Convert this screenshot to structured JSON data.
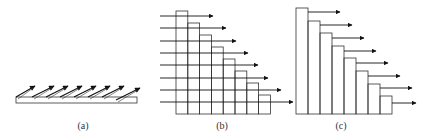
{
  "figure": {
    "stroke_color": "#333333",
    "arrow_color": "#111111",
    "panels": [
      {
        "id": "a",
        "label": "(a)",
        "label_x": 68,
        "description": "thin slab with 8 inclined arrows",
        "slab": {
          "x": 16,
          "y": 97,
          "w": 121,
          "h": 6
        },
        "arrows": [
          {
            "x1": 16,
            "y1": 97,
            "x2": 35,
            "y2": 86
          },
          {
            "x1": 32,
            "y1": 97,
            "x2": 54,
            "y2": 86
          },
          {
            "x1": 46,
            "y1": 97,
            "x2": 68,
            "y2": 86
          },
          {
            "x1": 60,
            "y1": 97,
            "x2": 82,
            "y2": 86
          },
          {
            "x1": 74,
            "y1": 97,
            "x2": 96,
            "y2": 86
          },
          {
            "x1": 88,
            "y1": 97,
            "x2": 110,
            "y2": 86
          },
          {
            "x1": 102,
            "y1": 97,
            "x2": 124,
            "y2": 86
          },
          {
            "x1": 116,
            "y1": 100,
            "x2": 140,
            "y2": 88
          }
        ]
      },
      {
        "id": "b",
        "label": "(b)",
        "label_x": 207,
        "description": "staircase of 8 columns crossed by 8 horizontal arrows",
        "base_x": 176,
        "base_y": 114,
        "col_w": 11.8,
        "col_tops": [
          11,
          23,
          35,
          47,
          59,
          71,
          83,
          95
        ],
        "arrows": [
          {
            "y": 16,
            "x1": 160,
            "x2": 213
          },
          {
            "y": 28,
            "x1": 160,
            "x2": 226
          },
          {
            "y": 41,
            "x1": 160,
            "x2": 236
          },
          {
            "y": 53,
            "x1": 160,
            "x2": 248
          },
          {
            "y": 65,
            "x1": 160,
            "x2": 258
          },
          {
            "y": 78,
            "x1": 160,
            "x2": 268
          },
          {
            "y": 90,
            "x1": 160,
            "x2": 281
          },
          {
            "y": 102,
            "x1": 160,
            "x2": 293
          }
        ]
      },
      {
        "id": "c",
        "label": "(c)",
        "label_x": 326,
        "description": "staircase of 8 columns with arrows leaving each step",
        "base_x": 296,
        "base_y": 114,
        "col_w": 12,
        "col_tops": [
          8,
          21,
          33,
          46,
          58,
          71,
          84,
          96
        ],
        "arrows": [
          {
            "y": 12,
            "x1": 308,
            "x2": 340
          },
          {
            "y": 25,
            "x1": 320,
            "x2": 352
          },
          {
            "y": 38,
            "x1": 332,
            "x2": 364
          },
          {
            "y": 51,
            "x1": 344,
            "x2": 376
          },
          {
            "y": 63,
            "x1": 356,
            "x2": 388
          },
          {
            "y": 76,
            "x1": 368,
            "x2": 400
          },
          {
            "y": 88,
            "x1": 380,
            "x2": 412
          },
          {
            "y": 103,
            "x1": 392,
            "x2": 416
          }
        ]
      }
    ]
  }
}
